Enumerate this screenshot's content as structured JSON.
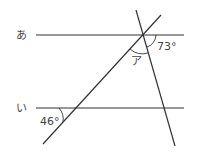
{
  "diagram": {
    "lines": {
      "a_label": "あ",
      "i_label": "い"
    },
    "angles": {
      "top_right": "73°",
      "unknown": "ア",
      "bottom_left": "46°"
    },
    "colors": {
      "stroke": "#333333",
      "text": "#444444"
    }
  }
}
